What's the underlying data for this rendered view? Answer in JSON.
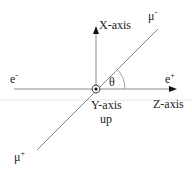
{
  "diagram": {
    "colors": {
      "line": "#8a8a8a",
      "text": "#222222",
      "arrow": "#111111",
      "scan_line": "#e6e6e6"
    },
    "origin": {
      "x": 96,
      "y": 89
    },
    "axes": {
      "x_axis": {
        "label": "X-axis",
        "direction": "up"
      },
      "y_axis": {
        "label": "Y-axis",
        "sublabel": "up",
        "direction": "out of page"
      },
      "z_axis": {
        "label": "Z-axis",
        "direction": "right"
      }
    },
    "beams": {
      "electron": {
        "label": "e",
        "charge": "-"
      },
      "positron": {
        "label": "e",
        "charge": "+"
      }
    },
    "products": {
      "muon_minus": {
        "label": "μ",
        "charge": "-"
      },
      "muon_plus": {
        "label": "μ",
        "charge": "+"
      }
    },
    "angle": {
      "label": "θ"
    }
  }
}
